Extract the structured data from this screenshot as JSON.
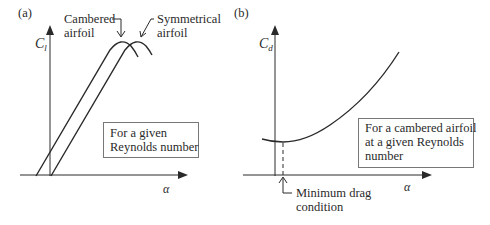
{
  "panels": [
    {
      "id": "a",
      "label": "(a)",
      "y_axis_label": "C",
      "y_axis_sub": "l",
      "x_axis_label": "α",
      "curve_labels": {
        "cambered_line1": "Cambered",
        "cambered_line2": "airfoil",
        "symmetrical_line1": "Symmetrical",
        "symmetrical_line2": "airfoil"
      },
      "note_line1": "For a given",
      "note_line2": "Reynolds number"
    },
    {
      "id": "b",
      "label": "(b)",
      "y_axis_label": "C",
      "y_axis_sub": "d",
      "x_axis_label": "α",
      "note_line1": "For a cambered airfoil",
      "note_line2": "at a given Reynolds",
      "note_line3": "number",
      "annotation_line1": "Minimum drag",
      "annotation_line2": "condition"
    }
  ],
  "colors": {
    "line": "#2a2a2a",
    "box_border": "#777777",
    "background": "#ffffff"
  }
}
